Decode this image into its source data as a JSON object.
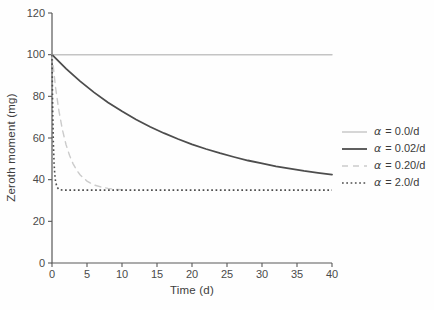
{
  "figure": {
    "background": "#fefefe",
    "axis_color": "#585858",
    "tick_label_color": "#4a4a4a"
  },
  "chart_data": {
    "type": "line",
    "title": "",
    "xlabel": "Time (d)",
    "ylabel": "Zeroth moment (mg)",
    "xlim": [
      0,
      40
    ],
    "ylim": [
      0,
      120
    ],
    "x_ticks": [
      0,
      5,
      10,
      15,
      20,
      25,
      30,
      35,
      40
    ],
    "y_ticks": [
      0,
      20,
      40,
      60,
      80,
      100,
      120
    ],
    "grid": false,
    "legend_position": "right-outside",
    "equilibrium_value": 35,
    "series": [
      {
        "name": "alpha-0.0",
        "label_symbol": "α",
        "label_rest": " = 0.0/d",
        "color": "#c4c4c4",
        "line_style": "solid",
        "width": 1.4,
        "points": [
          [
            0,
            100
          ],
          [
            40,
            100
          ]
        ]
      },
      {
        "name": "alpha-0.02",
        "label_symbol": "α",
        "label_rest": " = 0.02/d",
        "color": "#4d4d4d",
        "line_style": "solid",
        "width": 1.8,
        "points": [
          [
            0,
            100
          ],
          [
            2,
            93.3
          ],
          [
            4,
            87.3
          ],
          [
            6,
            81.9
          ],
          [
            8,
            77.1
          ],
          [
            10,
            72.8
          ],
          [
            12,
            68.9
          ],
          [
            14,
            65.4
          ],
          [
            16,
            62.3
          ],
          [
            18,
            59.5
          ],
          [
            20,
            57.0
          ],
          [
            22,
            54.7
          ],
          [
            24,
            52.7
          ],
          [
            26,
            50.9
          ],
          [
            28,
            49.2
          ],
          [
            30,
            47.8
          ],
          [
            32,
            46.4
          ],
          [
            34,
            45.3
          ],
          [
            36,
            44.2
          ],
          [
            38,
            43.3
          ],
          [
            40,
            42.4
          ]
        ]
      },
      {
        "name": "alpha-0.20",
        "label_symbol": "α",
        "label_rest": " = 0.20/d",
        "color": "#cbcbcb",
        "line_style": "dashed",
        "width": 1.4,
        "points": [
          [
            0,
            100
          ],
          [
            0.5,
            84.5
          ],
          [
            1,
            72.8
          ],
          [
            1.5,
            63.8
          ],
          [
            2,
            56.9
          ],
          [
            2.5,
            51.7
          ],
          [
            3,
            47.7
          ],
          [
            3.5,
            44.7
          ],
          [
            4,
            42.4
          ],
          [
            5,
            39.3
          ],
          [
            6,
            37.5
          ],
          [
            7,
            36.5
          ],
          [
            8,
            35.8
          ],
          [
            9,
            35.4
          ],
          [
            10,
            35.2
          ]
        ]
      },
      {
        "name": "alpha-2.0",
        "label_symbol": "α",
        "label_rest": " = 2.0/d",
        "color": "#4d4d4d",
        "line_style": "dotted",
        "width": 1.6,
        "points": [
          [
            0,
            100
          ],
          [
            0.1,
            72.8
          ],
          [
            0.2,
            56.9
          ],
          [
            0.3,
            47.7
          ],
          [
            0.4,
            42.4
          ],
          [
            0.5,
            39.3
          ],
          [
            0.7,
            36.5
          ],
          [
            1,
            35.3
          ],
          [
            1.5,
            35.0
          ],
          [
            5,
            35.0
          ],
          [
            10,
            35.0
          ],
          [
            15,
            35.0
          ],
          [
            20,
            35.0
          ],
          [
            25,
            35.0
          ],
          [
            30,
            35.0
          ],
          [
            35,
            35.0
          ],
          [
            40,
            35.0
          ]
        ]
      }
    ]
  }
}
